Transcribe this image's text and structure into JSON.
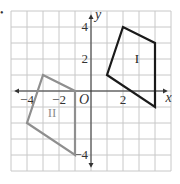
{
  "diagram": {
    "type": "coordinate-plane",
    "bullet": "•",
    "axes": {
      "x_label": "x",
      "y_label": "y",
      "origin_label": "O",
      "x_range": [
        -4.5,
        5
      ],
      "y_range": [
        -5,
        5
      ],
      "unit": 1
    },
    "x_ticks": [
      {
        "value": -4,
        "label": "−4"
      },
      {
        "value": -2,
        "label": "−2"
      },
      {
        "value": 2,
        "label": "2"
      }
    ],
    "y_ticks": [
      {
        "value": 4,
        "label": "4"
      },
      {
        "value": 2,
        "label": "2"
      },
      {
        "value": -4,
        "label": "−4"
      }
    ],
    "figures": [
      {
        "name": "I",
        "label": "I",
        "color": "#1a1a1a",
        "vertices": [
          [
            1,
            1
          ],
          [
            2,
            4
          ],
          [
            4,
            3
          ],
          [
            4,
            -1
          ]
        ]
      },
      {
        "name": "II",
        "label": "II",
        "color": "#8f8f8f",
        "vertices": [
          [
            -3,
            1
          ],
          [
            -1,
            0
          ],
          [
            -1,
            -4
          ],
          [
            -4,
            -2
          ]
        ]
      }
    ],
    "colors": {
      "grid": "#c8c8c8",
      "axis": "#333333"
    }
  }
}
